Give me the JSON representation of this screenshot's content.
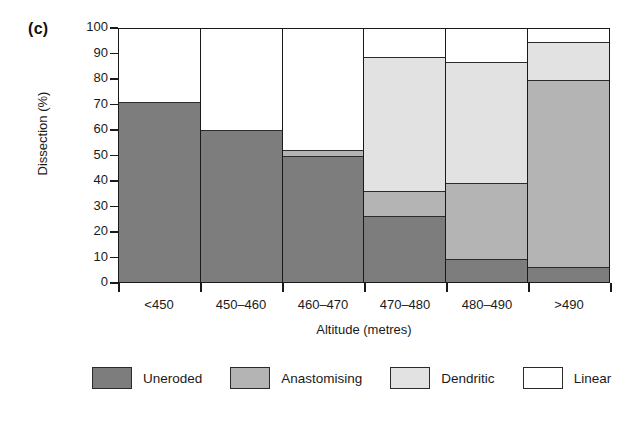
{
  "panel_label": "(c)",
  "chart_data": {
    "type": "bar",
    "subtype": "stacked-bar-100",
    "title": "",
    "xlabel": "Altitude (metres)",
    "ylabel": "Dissection (%)",
    "categories": [
      "<450",
      "450–460",
      "460–470",
      "470–480",
      "480–490",
      ">490"
    ],
    "series": [
      {
        "name": "Uneroded",
        "color": "#7d7d7d",
        "values": [
          71,
          60,
          50,
          26,
          9,
          6
        ]
      },
      {
        "name": "Anastomising",
        "color": "#b4b4b4",
        "values": [
          0,
          0,
          2,
          10,
          30,
          74
        ]
      },
      {
        "name": "Dendritic",
        "color": "#e2e2e2",
        "values": [
          0,
          0,
          0,
          53,
          48,
          15
        ]
      },
      {
        "name": "Linear",
        "color": "#ffffff",
        "values": [
          29,
          40,
          48,
          11,
          13,
          5
        ]
      }
    ],
    "cumulative_tops": {
      "<450": {
        "Uneroded": 71,
        "Anastomising": 71,
        "Dendritic": 71,
        "Linear": 100
      },
      "450–460": {
        "Uneroded": 60,
        "Anastomising": 60,
        "Dendritic": 60,
        "Linear": 100
      },
      "460–470": {
        "Uneroded": 50,
        "Anastomising": 52,
        "Dendritic": 52,
        "Linear": 100
      },
      "470–480": {
        "Uneroded": 26,
        "Anastomising": 36,
        "Dendritic": 89,
        "Linear": 100
      },
      "480–490": {
        "Uneroded": 9,
        "Anastomising": 39,
        "Dendritic": 87,
        "Linear": 100
      },
      ">490": {
        "Uneroded": 6,
        "Anastomising": 80,
        "Dendritic": 95,
        "Linear": 100
      }
    },
    "yticks": [
      0,
      10,
      20,
      30,
      40,
      50,
      60,
      70,
      80,
      90,
      100
    ],
    "ylim": [
      0,
      100
    ],
    "grid": false,
    "legend_position": "bottom"
  },
  "legend": {
    "items": [
      {
        "label": "Uneroded",
        "color": "#7d7d7d"
      },
      {
        "label": "Anastomising",
        "color": "#b4b4b4"
      },
      {
        "label": "Dendritic",
        "color": "#e2e2e2"
      },
      {
        "label": "Linear",
        "color": "#ffffff"
      }
    ]
  }
}
